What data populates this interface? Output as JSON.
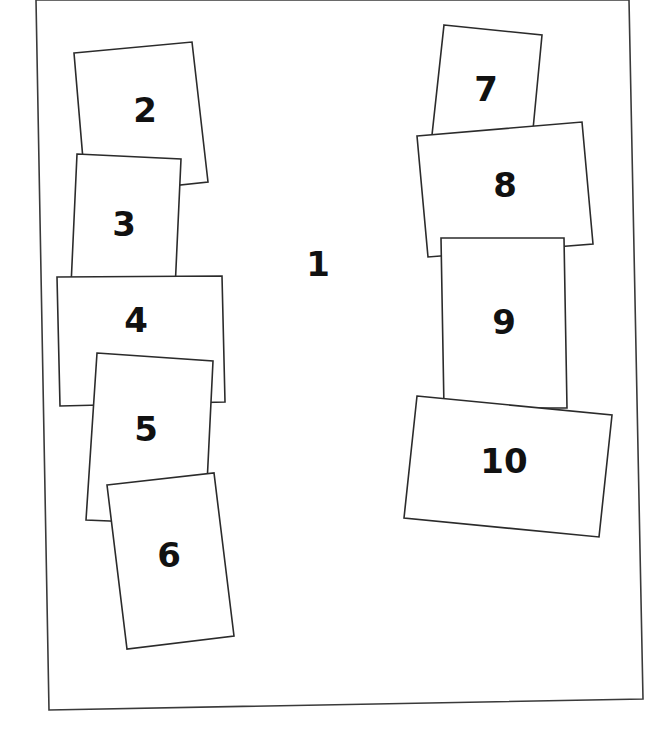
{
  "diagram": {
    "type": "overlapping-sheet-layout",
    "colors": {
      "background": "#ffffff",
      "outline": "#2b2b2b",
      "label": "#111111"
    },
    "frame": {
      "label": "1",
      "points": "36,0 629,0 643,699 49,710",
      "label_x": 318,
      "label_y": 266
    },
    "sheets": [
      {
        "label": "2",
        "points": "74,53 192,42 208,182 86,195",
        "label_x": 145,
        "label_y": 112
      },
      {
        "label": "3",
        "points": "77,154 181,159 175,290 71,286",
        "label_x": 124,
        "label_y": 226
      },
      {
        "label": "4",
        "points": "57,277 222,276 225,402 60,406",
        "label_x": 136,
        "label_y": 322
      },
      {
        "label": "5",
        "points": "97,353 213,361 205,525 86,520",
        "label_x": 146,
        "label_y": 431
      },
      {
        "label": "6",
        "points": "107,485 214,473 234,636 127,649",
        "label_x": 169,
        "label_y": 557
      },
      {
        "label": "7",
        "points": "444,25 542,35 532,140 432,135",
        "label_x": 486,
        "label_y": 91
      },
      {
        "label": "8",
        "points": "417,136 582,122 593,244 428,257",
        "label_x": 505,
        "label_y": 187
      },
      {
        "label": "9",
        "points": "441,238 564,238 567,408 444,408",
        "label_x": 504,
        "label_y": 324
      },
      {
        "label": "10",
        "points": "417,396 612,415 599,537 404,518",
        "label_x": 504,
        "label_y": 463
      }
    ]
  }
}
